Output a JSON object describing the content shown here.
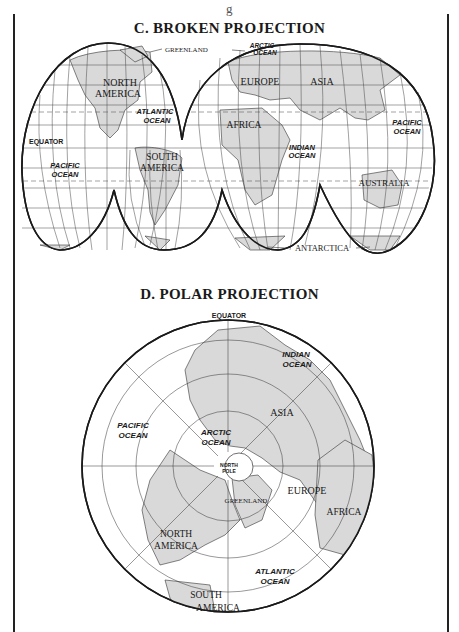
{
  "page": {
    "top_caption_fragment": "g"
  },
  "maps": [
    {
      "title": "C. BROKEN PROJECTION",
      "labels": {
        "greenland": "GREENLAND",
        "arctic_ocean_1": "ARCTIC",
        "arctic_ocean_2": "OCEAN",
        "north_america_1": "NORTH",
        "north_america_2": "AMERICA",
        "europe": "EUROPE",
        "asia": "ASIA",
        "atlantic_ocean_1": "ATLANTIC",
        "atlantic_ocean_2": "OCEAN",
        "africa": "AFRICA",
        "pacific_ocean_east_1": "PACIFIC",
        "pacific_ocean_east_2": "OCEAN",
        "equator": "EQUATOR",
        "indian_ocean_1": "INDIAN",
        "indian_ocean_2": "OCEAN",
        "pacific_ocean_west_1": "PACIFIC",
        "pacific_ocean_west_2": "OCEAN",
        "south_america_1": "SOUTH",
        "south_america_2": "AMERICA",
        "australia": "AUSTRALIA",
        "antarctica": "ANTARCTICA"
      }
    },
    {
      "title": "D. POLAR PROJECTION",
      "labels": {
        "equator": "EQUATOR",
        "indian_ocean_1": "INDIAN",
        "indian_ocean_2": "OCEAN",
        "asia": "ASIA",
        "pacific_ocean_1": "PACIFIC",
        "pacific_ocean_2": "OCEAN",
        "arctic_ocean_1": "ARCTIC",
        "arctic_ocean_2": "OCEAN",
        "north_pole_1": "NORTH",
        "north_pole_2": "POLE",
        "greenland": "GREENLAND",
        "europe": "EUROPE",
        "africa": "AFRICA",
        "north_america_1": "NORTH",
        "north_america_2": "AMERICA",
        "atlantic_ocean_1": "ATLANTIC",
        "atlantic_ocean_2": "OCEAN",
        "south_america_1": "SOUTH",
        "south_america_2": "AMERICA"
      }
    }
  ],
  "colors": {
    "land": "#d9d9d9",
    "ink": "#1a1a1a",
    "grid": "#333333",
    "paper": "#ffffff"
  }
}
